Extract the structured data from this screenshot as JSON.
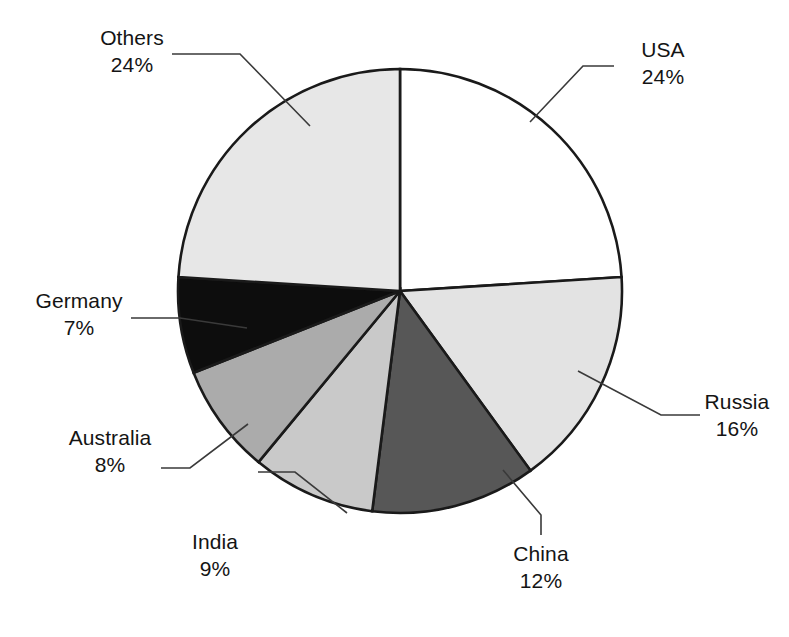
{
  "chart_data": {
    "type": "pie",
    "title": "",
    "subtitle": "",
    "xlabel": "",
    "ylabel": "",
    "legend_position": "none",
    "grid": false,
    "units": "percent",
    "start_angle_deg": 0,
    "direction": "clockwise",
    "categories": [
      "USA",
      "Russia",
      "China",
      "India",
      "Australia",
      "Germany",
      "Others"
    ],
    "values": [
      24,
      16,
      12,
      9,
      8,
      7,
      24
    ],
    "labels": [
      "24%",
      "16%",
      "12%",
      "9%",
      "8%",
      "7%",
      "24%"
    ],
    "colors": [
      "#ffffff",
      "#e3e3e3",
      "#575757",
      "#c9c9c9",
      "#ababab",
      "#0d0d0d",
      "#e7e7e7"
    ],
    "slices": [
      {
        "name": "USA",
        "value": 24,
        "label": "24%",
        "color": "#ffffff"
      },
      {
        "name": "Russia",
        "value": 16,
        "label": "16%",
        "color": "#e3e3e3"
      },
      {
        "name": "China",
        "value": 12,
        "label": "12%",
        "color": "#575757"
      },
      {
        "name": "India",
        "value": 9,
        "label": "9%",
        "color": "#c9c9c9"
      },
      {
        "name": "Australia",
        "value": 8,
        "label": "8%",
        "color": "#ababab"
      },
      {
        "name": "Germany",
        "value": 7,
        "label": "7%",
        "color": "#0d0d0d"
      },
      {
        "name": "Others",
        "value": 24,
        "label": "24%",
        "color": "#e7e7e7"
      }
    ],
    "total": 100
  },
  "callouts": {
    "others": {
      "name": "Others",
      "pct": "24%"
    },
    "usa": {
      "name": "USA",
      "pct": "24%"
    },
    "russia": {
      "name": "Russia",
      "pct": "16%"
    },
    "china": {
      "name": "China",
      "pct": "12%"
    },
    "india": {
      "name": "India",
      "pct": "9%"
    },
    "australia": {
      "name": "Australia",
      "pct": "8%"
    },
    "germany": {
      "name": "Germany",
      "pct": "7%"
    }
  }
}
